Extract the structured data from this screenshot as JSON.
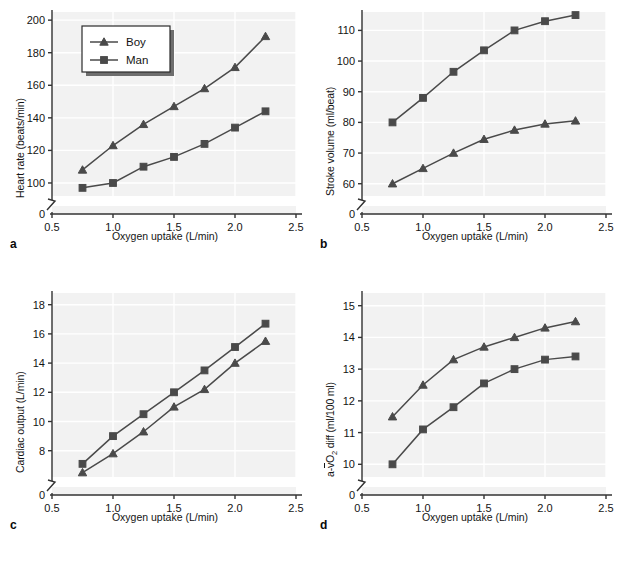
{
  "figure": {
    "panel_count": 4,
    "background": "#ffffff",
    "plot_background": "#f2f2f2",
    "grid_color": "#ffffff",
    "series_color": "#4a4a4a",
    "axis_color": "#333333"
  },
  "common": {
    "xlabel": "Oxygen uptake (L/min)",
    "x_ticks": [
      "0.5",
      "1.0",
      "1.5",
      "2.0",
      "2.5"
    ],
    "x_values": [
      0.5,
      1.0,
      1.5,
      2.0,
      2.5
    ],
    "zero_label": "0",
    "x_data": [
      0.75,
      1.0,
      1.25,
      1.5,
      1.75,
      2.0,
      2.25
    ],
    "legend": {
      "boy_label": "Boy",
      "man_label": "Man",
      "boy_marker": "triangle",
      "man_marker": "square"
    }
  },
  "panels": [
    {
      "letter": "a",
      "ylabel": "Heart rate (beats/min)",
      "y_ticks": [
        "100",
        "120",
        "140",
        "160",
        "180",
        "200"
      ],
      "has_legend": true
    },
    {
      "letter": "b",
      "ylabel": "Stroke volume (ml/beat)",
      "y_ticks": [
        "60",
        "70",
        "80",
        "90",
        "100",
        "110"
      ],
      "has_legend": false
    },
    {
      "letter": "c",
      "ylabel": "Cardiac output (L/min)",
      "y_ticks": [
        "8",
        "10",
        "12",
        "14",
        "16",
        "18"
      ],
      "has_legend": false
    },
    {
      "letter": "d",
      "ylabel_parts": {
        "prefix": "a-",
        "overline": "v",
        "element": "O",
        "subscript": "2",
        "suffix": " diff (ml/100 ml)"
      },
      "ylabel": "a-vO2 diff (ml/100 ml)",
      "y_ticks": [
        "10",
        "11",
        "12",
        "13",
        "14",
        "15"
      ],
      "has_legend": false
    }
  ],
  "chart_data": [
    {
      "type": "line",
      "panel": "a",
      "title": "",
      "xlabel": "Oxygen uptake (L/min)",
      "ylabel": "Heart rate (beats/min)",
      "x": [
        0.75,
        1.0,
        1.25,
        1.5,
        1.75,
        2.0,
        2.25
      ],
      "xlim": [
        0.5,
        2.5
      ],
      "ylim": [
        92,
        205
      ],
      "y_ticks": [
        100,
        120,
        140,
        160,
        180,
        200
      ],
      "x_ticks": [
        0.5,
        1.0,
        1.5,
        2.0,
        2.5
      ],
      "grid": true,
      "legend_position": "upper-left",
      "axis_break_y": true,
      "series": [
        {
          "name": "Boy",
          "marker": "triangle",
          "values": [
            108,
            123,
            136,
            147,
            158,
            171,
            190
          ]
        },
        {
          "name": "Man",
          "marker": "square",
          "values": [
            97,
            100,
            110,
            116,
            124,
            134,
            144
          ]
        }
      ]
    },
    {
      "type": "line",
      "panel": "b",
      "title": "",
      "xlabel": "Oxygen uptake (L/min)",
      "ylabel": "Stroke volume (ml/beat)",
      "x": [
        0.75,
        1.0,
        1.25,
        1.5,
        1.75,
        2.0,
        2.25
      ],
      "xlim": [
        0.5,
        2.5
      ],
      "ylim": [
        56,
        116
      ],
      "y_ticks": [
        60,
        70,
        80,
        90,
        100,
        110
      ],
      "x_ticks": [
        0.5,
        1.0,
        1.5,
        2.0,
        2.5
      ],
      "grid": true,
      "legend_position": "none",
      "axis_break_y": true,
      "series": [
        {
          "name": "Boy",
          "marker": "triangle",
          "values": [
            60,
            65,
            70,
            74.5,
            77.5,
            79.5,
            80.5
          ]
        },
        {
          "name": "Man",
          "marker": "square",
          "values": [
            80,
            88,
            96.5,
            103.5,
            110,
            113,
            115
          ]
        }
      ]
    },
    {
      "type": "line",
      "panel": "c",
      "title": "",
      "xlabel": "Oxygen uptake (L/min)",
      "ylabel": "Cardiac output (L/min)",
      "x": [
        0.75,
        1.0,
        1.25,
        1.5,
        1.75,
        2.0,
        2.25
      ],
      "xlim": [
        0.5,
        2.5
      ],
      "ylim": [
        6.2,
        18.8
      ],
      "y_ticks": [
        8,
        10,
        12,
        14,
        16,
        18
      ],
      "x_ticks": [
        0.5,
        1.0,
        1.5,
        2.0,
        2.5
      ],
      "grid": true,
      "legend_position": "none",
      "axis_break_y": true,
      "series": [
        {
          "name": "Boy",
          "marker": "triangle",
          "values": [
            6.5,
            7.8,
            9.3,
            11.0,
            12.2,
            14.0,
            15.5
          ]
        },
        {
          "name": "Man",
          "marker": "square",
          "values": [
            7.1,
            9.0,
            10.5,
            12.0,
            13.5,
            15.1,
            16.7
          ]
        }
      ]
    },
    {
      "type": "line",
      "panel": "d",
      "title": "",
      "xlabel": "Oxygen uptake (L/min)",
      "ylabel": "a-vO2 diff (ml/100 ml)",
      "x": [
        0.75,
        1.0,
        1.25,
        1.5,
        1.75,
        2.0,
        2.25
      ],
      "xlim": [
        0.5,
        2.5
      ],
      "ylim": [
        9.6,
        15.4
      ],
      "y_ticks": [
        10,
        11,
        12,
        13,
        14,
        15
      ],
      "x_ticks": [
        0.5,
        1.0,
        1.5,
        2.0,
        2.5
      ],
      "grid": true,
      "legend_position": "none",
      "axis_break_y": true,
      "series": [
        {
          "name": "Boy",
          "marker": "triangle",
          "values": [
            11.5,
            12.5,
            13.3,
            13.7,
            14.0,
            14.3,
            14.5
          ]
        },
        {
          "name": "Man",
          "marker": "square",
          "values": [
            10.0,
            11.1,
            11.8,
            12.55,
            13.0,
            13.3,
            13.4
          ]
        }
      ]
    }
  ]
}
